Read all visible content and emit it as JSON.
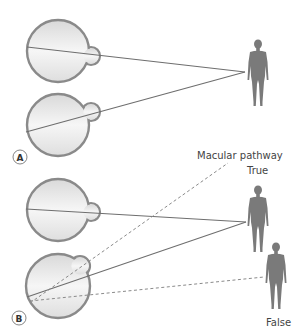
{
  "panels": [
    {
      "id": "A",
      "label": "A"
    },
    {
      "id": "B",
      "label": "B"
    }
  ],
  "annotations": {
    "macular_pathway": "Macular pathway",
    "true_label": "True",
    "false_label": "False"
  },
  "colors": {
    "eye_outline": "#8a8a8a",
    "eye_fill": "#e8e8e8",
    "line": "#6e6e6e",
    "figure": "#7a7a7a"
  }
}
